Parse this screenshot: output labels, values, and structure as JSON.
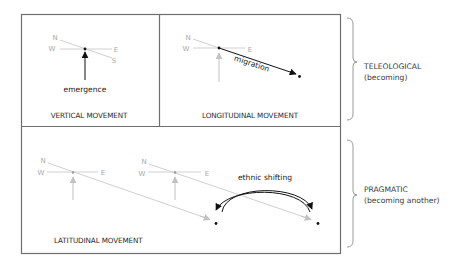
{
  "colors": {
    "frame": "#6e6e6e",
    "faint_line": "#d0d0d0",
    "faint_arrow": "#c2c2c2",
    "compass_text": "#a8a8a8",
    "primary_arrow": "#111111",
    "brace": "#9a9a9a"
  },
  "panels": {
    "vertical": {
      "caption": "VERTICAL MOVEMENT",
      "compass": {
        "n": "N",
        "w": "W",
        "e": "E",
        "s": "S"
      },
      "action_label": "emergence"
    },
    "longitudinal": {
      "caption": "LONGITUDINAL MOVEMENT",
      "compass": {
        "n": "N",
        "w": "W",
        "e": "E"
      },
      "action_label": "migration"
    },
    "latitudinal": {
      "caption": "LATITUDINAL MOVEMENT",
      "compass_1": {
        "n": "N",
        "w": "W",
        "e": "E"
      },
      "compass_2": {
        "n": "N",
        "w": "W",
        "e": "E"
      },
      "action_label": "ethnic shifting"
    }
  },
  "groups": [
    {
      "title": "TELEOLOGICAL",
      "subtitle": "(becoming)"
    },
    {
      "title": "PRAGMATIC",
      "subtitle": "(becoming another)"
    }
  ]
}
